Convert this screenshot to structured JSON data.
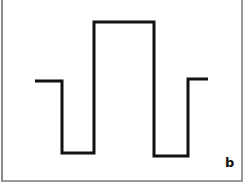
{
  "figure": {
    "panel_label": "b",
    "stroke_color": "#111111",
    "waveform": {
      "description": "square-like pulse waveform: mid level, low, high, low, mid",
      "points": [
        [
          35,
          81
        ],
        [
          62,
          81
        ],
        [
          62,
          153
        ],
        [
          94,
          153
        ],
        [
          94,
          22
        ],
        [
          154,
          22
        ],
        [
          154,
          156
        ],
        [
          188,
          156
        ],
        [
          188,
          79
        ],
        [
          208,
          79
        ]
      ]
    }
  }
}
